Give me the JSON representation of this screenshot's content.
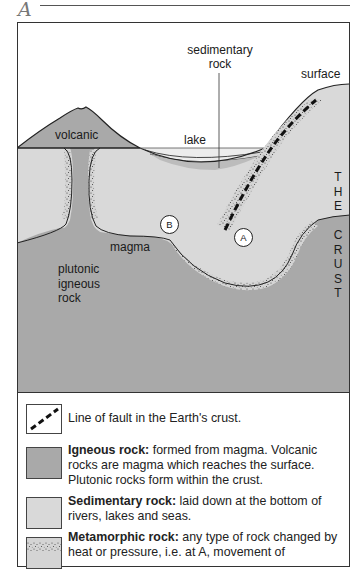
{
  "header": {
    "letter": "A"
  },
  "diagram": {
    "labels": {
      "sedimentary_rock_line1": "sedimentary",
      "sedimentary_rock_line2": "rock",
      "surface": "surface",
      "volcanic": "volcanic",
      "lake": "lake",
      "magma": "magma",
      "plutonic_line1": "plutonic",
      "plutonic_line2": "igneous",
      "plutonic_line3": "rock",
      "crust_vertical": [
        "T",
        "H",
        "E",
        "",
        "C",
        "R",
        "U",
        "S",
        "T"
      ]
    },
    "markers": {
      "a": "A",
      "b": "B"
    },
    "colors": {
      "igneous": "#a9a9a9",
      "sedimentary": "#d9d9d9",
      "lake": "#ececec",
      "outline": "#222222",
      "fault": "#111111"
    }
  },
  "legend": {
    "items": [
      {
        "key": "fault",
        "bold": "",
        "text": "Line of fault in the Earth's crust."
      },
      {
        "key": "igneous",
        "bold": "Igneous rock:",
        "text": " formed from magma. Volcanic rocks are magma which reaches the surface. Plutonic rocks  form within the crust."
      },
      {
        "key": "sedimentary",
        "bold": "Sedimentary rock:",
        "text": " laid down at the bottom of rivers, lakes and seas."
      },
      {
        "key": "metamorphic",
        "bold": "Metamorphic rock:",
        "text": " any type of rock changed by heat or pressure, i.e. at  A, movement of"
      }
    ]
  }
}
